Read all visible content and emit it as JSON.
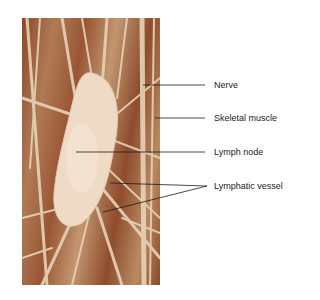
{
  "figure": {
    "labels": [
      {
        "id": "nerve",
        "text": "Nerve"
      },
      {
        "id": "skeletal-muscle",
        "text": "Skeletal muscle"
      },
      {
        "id": "lymph-node",
        "text": "Lymph node"
      },
      {
        "id": "lymphatic-vessel",
        "text": "Lymphatic vessel"
      }
    ],
    "colors": {
      "tissue_dark": "#8a4a2a",
      "tissue_light": "#c29670",
      "strand": "#e8d6bd",
      "node": "#f0dccb",
      "leader_line": "#1a1a1a"
    }
  }
}
